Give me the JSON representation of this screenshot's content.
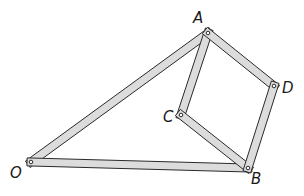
{
  "diagram": {
    "type": "linkage",
    "colors": {
      "bar_fill": "#dcdcdc",
      "bar_outline": "#2a2a2a",
      "pin": "#ffffff",
      "label": "#1a1a1a"
    },
    "bar_width": 8,
    "joints": [
      {
        "id": "A",
        "label": "A",
        "x": 208,
        "y": 33,
        "label_x": 193,
        "label_y": 23
      },
      {
        "id": "D",
        "label": "D",
        "x": 274,
        "y": 86,
        "label_x": 282,
        "label_y": 93
      },
      {
        "id": "C",
        "label": "C",
        "x": 181,
        "y": 115,
        "label_x": 163,
        "label_y": 122
      },
      {
        "id": "O",
        "label": "O",
        "x": 31,
        "y": 162,
        "label_x": 10,
        "label_y": 178
      },
      {
        "id": "B",
        "label": "B",
        "x": 248,
        "y": 168,
        "label_x": 251,
        "label_y": 184
      }
    ],
    "bars": [
      {
        "from": "O",
        "to": "A"
      },
      {
        "from": "O",
        "to": "B"
      },
      {
        "from": "A",
        "to": "C"
      },
      {
        "from": "A",
        "to": "D"
      },
      {
        "from": "C",
        "to": "B"
      },
      {
        "from": "D",
        "to": "B"
      }
    ]
  }
}
